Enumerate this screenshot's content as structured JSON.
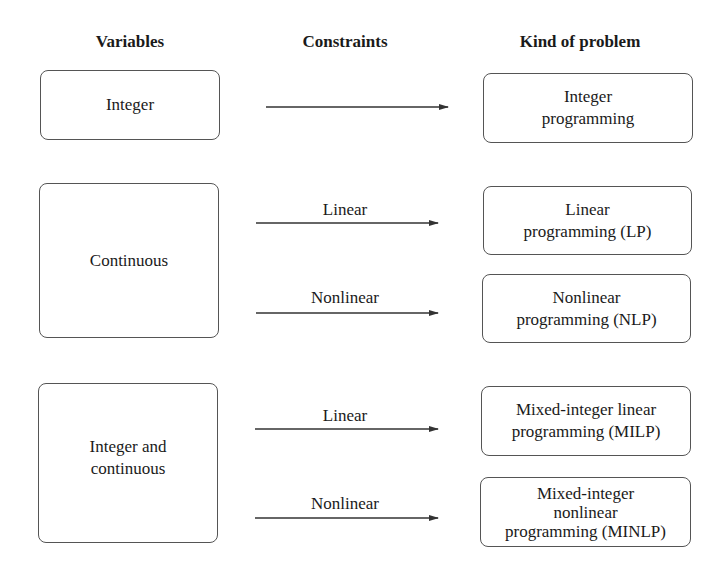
{
  "headers": {
    "variables": "Variables",
    "constraints": "Constraints",
    "kind": "Kind of problem"
  },
  "variables": [
    {
      "label": "Integer"
    },
    {
      "label": "Continuous"
    },
    {
      "label_line1": "Integer and",
      "label_line2": "continuous"
    }
  ],
  "constraints": {
    "linear_1": "Linear",
    "nonlinear_1": "Nonlinear",
    "linear_2": "Linear",
    "nonlinear_2": "Nonlinear"
  },
  "problems": [
    {
      "line1": "Integer",
      "line2": "programming"
    },
    {
      "line1": "Linear",
      "line2": "programming (LP)"
    },
    {
      "line1": "Nonlinear",
      "line2": "programming (NLP)"
    },
    {
      "line1": "Mixed-integer linear",
      "line2": "programming (MILP)"
    },
    {
      "line1": "Mixed-integer",
      "line2": "nonlinear",
      "line3": "programming (MINLP)"
    }
  ],
  "colors": {
    "stroke": "#555555",
    "text": "#1a1a1a",
    "arrow": "#333333"
  }
}
